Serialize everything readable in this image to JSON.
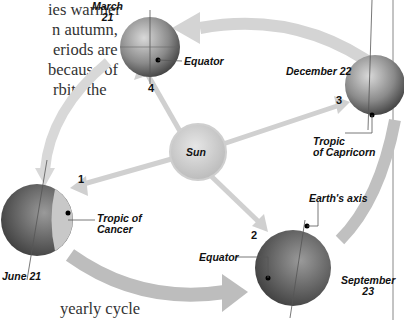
{
  "text_fragments": [
    "ies warmer",
    "n autumn,",
    "eriods are",
    "because of",
    "rbits the",
    "yearly cycle"
  ],
  "diagram": {
    "center": {
      "label": "Sun"
    },
    "positions": [
      {
        "number": "1",
        "date": "June 21",
        "callout": "Tropic of Cancer",
        "callout_line1": "Tropic of",
        "callout_line2": "Cancer"
      },
      {
        "number": "2",
        "date_line1": "September",
        "date_line2": "23",
        "callout": "Equator",
        "axis_label": "Earth's axis"
      },
      {
        "number": "3",
        "date": "December 22",
        "callout_line1": "Tropic",
        "callout_line2": "of Capricorn"
      },
      {
        "number": "4",
        "date_line1": "March",
        "date_line2": "21",
        "callout": "Equator"
      }
    ],
    "colors": {
      "arrow": "#c8c8c8",
      "globe_light": "#bdbdbd",
      "globe_dark": "#4a4a4a",
      "sun": "#d6d6d6",
      "rule": "#888888"
    }
  }
}
